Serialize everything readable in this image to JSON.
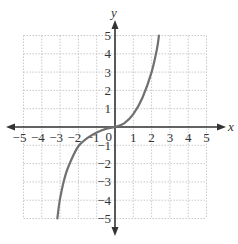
{
  "chart_data": {
    "type": "line",
    "title": "",
    "xlabel": "x",
    "ylabel": "y",
    "xlim": [
      -5,
      5
    ],
    "ylim": [
      -5,
      5
    ],
    "grid": true,
    "x_ticks": [
      "-5",
      "-4",
      "-3",
      "-2",
      "-1",
      "1",
      "2",
      "3",
      "4",
      "5"
    ],
    "y_ticks": [
      "5",
      "4",
      "3",
      "2",
      "1",
      "-1",
      "-2",
      "-3",
      "-4",
      "-5"
    ],
    "origin_label": "0",
    "series": [
      {
        "name": "curve",
        "points": [
          [
            -3.15,
            -5
          ],
          [
            -3.0,
            -3.9
          ],
          [
            -2.7,
            -2.6
          ],
          [
            -2.3,
            -1.6
          ],
          [
            -2.0,
            -1.05
          ],
          [
            -1.5,
            -0.6
          ],
          [
            -1.0,
            -0.3
          ],
          [
            -0.5,
            -0.1
          ],
          [
            0,
            0
          ],
          [
            0.5,
            0.2
          ],
          [
            1.0,
            0.7
          ],
          [
            1.5,
            1.6
          ],
          [
            2.0,
            3.0
          ],
          [
            2.3,
            4.3
          ],
          [
            2.4,
            5
          ]
        ]
      }
    ],
    "colors": {
      "curve": "#707070",
      "axes": "#333333",
      "grid": "#bbbbbb"
    }
  }
}
